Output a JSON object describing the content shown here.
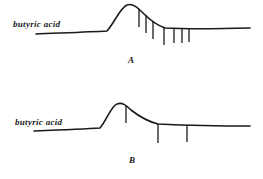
{
  "figure": {
    "ink_color": "#1a1a1a",
    "background": "#ffffff",
    "panels": [
      {
        "id": "A",
        "trace_label": "butyric acid",
        "panel_label": "A",
        "trace_path": "M36,34 C60,33 90,32 107,31 C115,22 120,8 127,5 C133,3 138,8 143,13 C150,20 156,25 165,28 C185,29 210,29 250,28",
        "markers": [
          {
            "x": 139,
            "y1": 10,
            "y2": 27
          },
          {
            "x": 146,
            "y1": 15,
            "y2": 33
          },
          {
            "x": 153,
            "y1": 21,
            "y2": 39
          },
          {
            "x": 164,
            "y1": 27,
            "y2": 45
          },
          {
            "x": 174,
            "y1": 29,
            "y2": 43
          },
          {
            "x": 182,
            "y1": 29,
            "y2": 43
          },
          {
            "x": 189,
            "y1": 29,
            "y2": 42
          }
        ]
      },
      {
        "id": "B",
        "trace_label": "butyric acid",
        "panel_label": "B",
        "trace_path": "M34,131 C60,130 85,129 100,128 C107,120 111,106 117,104 C122,102 126,105 131,110 C140,117 150,122 158,124 C180,125 210,126 250,126",
        "markers": [
          {
            "x": 126,
            "y1": 106,
            "y2": 123
          },
          {
            "x": 158,
            "y1": 124,
            "y2": 143
          },
          {
            "x": 187,
            "y1": 125,
            "y2": 142
          }
        ]
      }
    ]
  }
}
